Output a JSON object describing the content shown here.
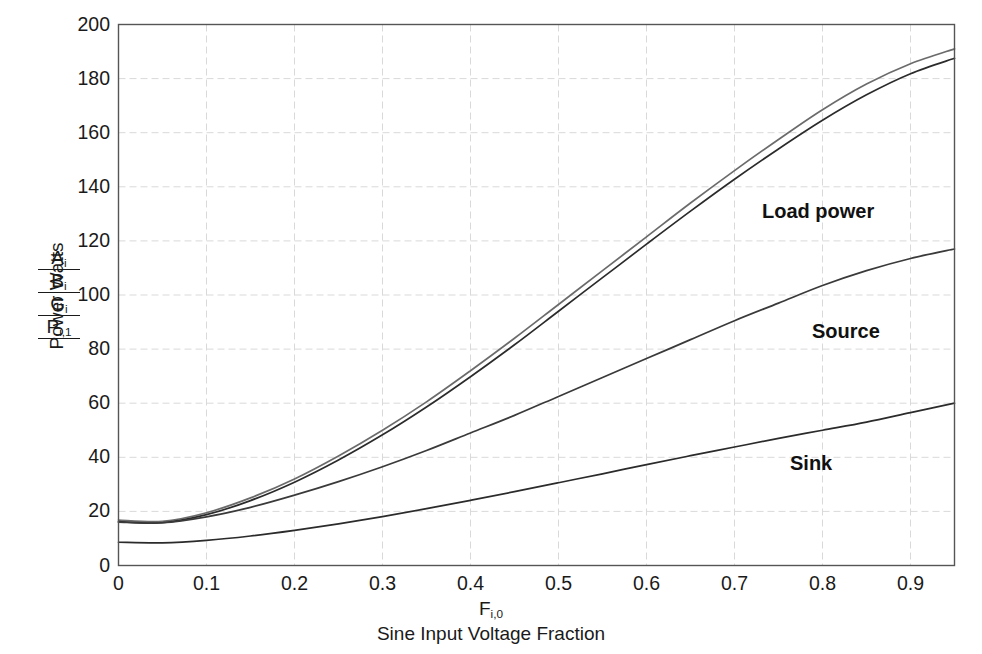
{
  "chart_data": {
    "type": "line",
    "title": "",
    "subtitle": "",
    "xlabel": "F_i,0 — Sine Input Voltage Fraction",
    "ylabel": "Power Watts  A_i / B_i / G_i / P_i,1",
    "xlim": [
      0,
      0.95
    ],
    "ylim": [
      0,
      200
    ],
    "xticks": [
      0,
      0.1,
      0.2,
      0.3,
      0.4,
      0.5,
      0.6,
      0.7,
      0.8,
      0.9
    ],
    "yticks": [
      0,
      20,
      40,
      60,
      80,
      100,
      120,
      140,
      160,
      180,
      200
    ],
    "xtick_labels": [
      "0",
      "0.1",
      "0.2",
      "0.3",
      "0.4",
      "0.5",
      "0.6",
      "0.7",
      "0.8",
      "0.9"
    ],
    "ytick_labels": [
      "0",
      "20",
      "40",
      "60",
      "80",
      "100",
      "120",
      "140",
      "160",
      "180",
      "200"
    ],
    "grid": true,
    "grid_style": "dashed",
    "grid_color": "#d9d9d9",
    "legend_position": "inline-annotations",
    "x": [
      0.0,
      0.05,
      0.1,
      0.15,
      0.2,
      0.25,
      0.3,
      0.35,
      0.4,
      0.45,
      0.5,
      0.55,
      0.6,
      0.65,
      0.7,
      0.75,
      0.8,
      0.85,
      0.9,
      0.95
    ],
    "series": [
      {
        "name": "Load power (upper)",
        "label": "A_i",
        "color": "#6b6b6b",
        "values": [
          16.8,
          16.3,
          19.5,
          25.0,
          32.0,
          40.5,
          50.0,
          60.5,
          72.0,
          84.0,
          96.5,
          109.0,
          121.5,
          134.0,
          146.0,
          157.5,
          168.5,
          178.0,
          185.5,
          191.0
        ]
      },
      {
        "name": "Load power (lower)",
        "label": "B_i",
        "color": "#2b2b2b",
        "values": [
          16.2,
          15.8,
          18.8,
          24.0,
          30.8,
          39.0,
          48.3,
          58.6,
          69.8,
          81.6,
          94.0,
          106.4,
          118.8,
          131.0,
          142.8,
          154.0,
          164.6,
          174.0,
          181.8,
          187.5
        ]
      },
      {
        "name": "Source",
        "label": "G_i",
        "color": "#3a3a3a",
        "values": [
          16.0,
          15.8,
          18.0,
          21.5,
          26.0,
          31.0,
          36.5,
          42.5,
          49.0,
          55.5,
          62.5,
          69.5,
          76.5,
          83.5,
          90.5,
          97.0,
          103.5,
          109.0,
          113.5,
          117.0
        ]
      },
      {
        "name": "Sink",
        "label": "P_i,1",
        "color": "#2b2b2b",
        "values": [
          8.6,
          8.4,
          9.3,
          10.9,
          13.0,
          15.4,
          18.1,
          21.0,
          24.1,
          27.3,
          30.6,
          33.9,
          37.3,
          40.6,
          43.8,
          47.0,
          50.0,
          53.0,
          56.5,
          60.0
        ]
      }
    ],
    "annotations": [
      {
        "text": "Load power",
        "x_px": 762,
        "y_px": 200
      },
      {
        "text": "Source",
        "x_px": 812,
        "y_px": 320
      },
      {
        "text": "Sink",
        "x_px": 790,
        "y_px": 452
      }
    ]
  },
  "axes": {
    "y_axis_title": "Power Watts",
    "y_symbol_stack": [
      {
        "base": "A",
        "sub": "i"
      },
      {
        "base": "B",
        "sub": "i"
      },
      {
        "base": "G",
        "sub": "i"
      },
      {
        "base": "P",
        "sub": "i,1"
      }
    ],
    "x_axis_symbol_base": "F",
    "x_axis_symbol_sub": "i,0",
    "x_axis_title": "Sine Input Voltage Fraction"
  },
  "style": {
    "frame_color": "#555555",
    "background": "#ffffff",
    "text_color": "#1a1a1a"
  }
}
